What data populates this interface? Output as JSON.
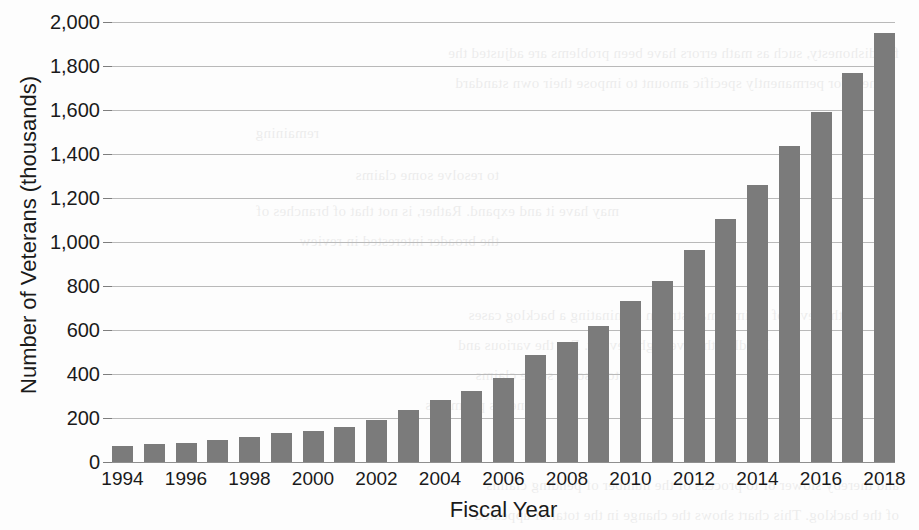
{
  "chart_data": {
    "type": "bar",
    "title": "",
    "xlabel": "Fiscal Year",
    "ylabel": "Number of Veterans (thousands)",
    "ylim": [
      0,
      2000
    ],
    "ytick_values": [
      0,
      200,
      400,
      600,
      800,
      1000,
      1200,
      1400,
      1600,
      1800,
      2000
    ],
    "ytick_labels": [
      "0",
      "200",
      "400",
      "600",
      "800",
      "1,000",
      "1,200",
      "1,400",
      "1,600",
      "1,800",
      "2,000"
    ],
    "grid": true,
    "legend": "none",
    "bar_color": "#7b7b7b",
    "categories": [
      "1994",
      "1995",
      "1996",
      "1997",
      "1998",
      "1999",
      "2000",
      "2001",
      "2002",
      "2003",
      "2004",
      "2005",
      "2006",
      "2007",
      "2008",
      "2009",
      "2010",
      "2011",
      "2012",
      "2013",
      "2014",
      "2015",
      "2016",
      "2017",
      "2018"
    ],
    "xtick_labels": [
      "1994",
      "1996",
      "1998",
      "2000",
      "2002",
      "2004",
      "2006",
      "2008",
      "2010",
      "2012",
      "2014",
      "2016",
      "2018"
    ],
    "values": [
      75,
      80,
      86,
      98,
      112,
      132,
      140,
      158,
      190,
      235,
      280,
      325,
      380,
      485,
      545,
      620,
      730,
      825,
      965,
      1105,
      1260,
      1435,
      1590,
      1770,
      1950
    ]
  },
  "ghost_text": {
    "lines": [
      "for dishonesty, such as math errors have been problems are adjusted the",
      "others for permanently specific amount to impose their own standard",
      "remaining",
      "to resolve some claims",
      "may have it and expand. Rather, is not that of branches of",
      "the broader interested in review",
      "in the level of claims, mainstream dominating a backlog cases",
      "handled the oversight review. For the various and",
      "to resolve some claims",
      "benefits payments",
      "and thereby slower or to process of the number of pending claims",
      "of the backlog. This chart shows the change in the total of appealed"
    ]
  }
}
